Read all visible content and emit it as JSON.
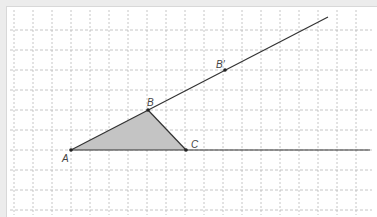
{
  "diagram": {
    "type": "geometry-construction",
    "grid": {
      "x_lines": [
        14,
        33,
        52,
        71,
        90,
        109,
        128,
        147,
        166,
        185,
        204,
        223,
        242,
        261,
        280,
        299,
        318,
        337,
        356
      ],
      "y_lines": [
        30,
        50,
        70,
        90,
        110,
        130,
        150,
        170,
        190,
        210
      ],
      "color": "#b8b8b8"
    },
    "points": {
      "A": {
        "label": "A",
        "x": 71,
        "y": 150
      },
      "B": {
        "label": "B",
        "x": 148,
        "y": 110
      },
      "C": {
        "label": "C",
        "x": 186,
        "y": 150
      },
      "B_prime": {
        "label": "B'",
        "x": 225,
        "y": 70
      }
    },
    "rays": [
      {
        "name": "ray-AB",
        "from": [
          71,
          150
        ],
        "to": [
          328,
          17
        ]
      },
      {
        "name": "ray-AC",
        "from": [
          71,
          150
        ],
        "to": [
          370,
          150
        ]
      }
    ],
    "triangle": {
      "vertices": [
        "A",
        "B",
        "C"
      ],
      "fill": "#c4c4c4"
    },
    "colors": {
      "line": "#333333",
      "point": "#222222",
      "label": "#444444",
      "background": "#ffffff",
      "outer": "#ececec"
    }
  }
}
